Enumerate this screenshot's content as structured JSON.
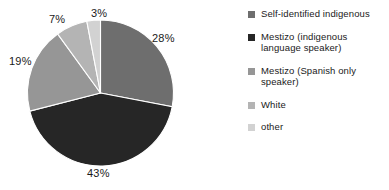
{
  "chart_data": {
    "type": "pie",
    "title": "",
    "categories": [
      "Self-identified indigenous",
      "Mestizo (indigenous language speaker)",
      "Mestizo (Spanish only speaker)",
      "White",
      "other"
    ],
    "values": [
      28,
      43,
      19,
      7,
      3
    ],
    "value_labels": [
      "28%",
      "43%",
      "19%",
      "7%",
      "3%"
    ],
    "units": "percent",
    "start_angle_deg": 0,
    "direction": "clockwise",
    "legend_position": "right",
    "grid": false,
    "colors": [
      "#6e6e6e",
      "#262626",
      "#969696",
      "#b4b4b4",
      "#d2d2d2"
    ],
    "slices": [
      {
        "label": "Self-identified indigenous",
        "value": 28,
        "value_label": "28%",
        "color": "#6e6e6e"
      },
      {
        "label": "Mestizo (indigenous language speaker)",
        "value": 43,
        "value_label": "43%",
        "color": "#262626"
      },
      {
        "label": "Mestizo (Spanish only speaker)",
        "value": 19,
        "value_label": "19%",
        "color": "#969696"
      },
      {
        "label": "White",
        "value": 7,
        "value_label": "7%",
        "color": "#b4b4b4"
      },
      {
        "label": "other",
        "value": 3,
        "value_label": "3%",
        "color": "#d2d2d2"
      }
    ]
  },
  "pie": {
    "labels": {
      "p28": "28%",
      "p43": "43%",
      "p19": "19%",
      "p7": "7%",
      "p3": "3%"
    }
  },
  "legend": {
    "items": [
      {
        "label_line1": "Self-identified indigenous",
        "label_line2": "",
        "color": "#6e6e6e"
      },
      {
        "label_line1": "Mestizo (indigenous",
        "label_line2": "language speaker)",
        "color": "#262626"
      },
      {
        "label_line1": "Mestizo (Spanish only",
        "label_line2": "speaker)",
        "color": "#969696"
      },
      {
        "label_line1": "White",
        "label_line2": "",
        "color": "#b4b4b4"
      },
      {
        "label_line1": "other",
        "label_line2": "",
        "color": "#d2d2d2"
      }
    ]
  }
}
